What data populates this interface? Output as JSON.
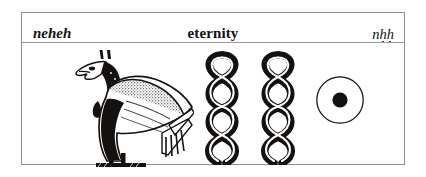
{
  "figure": {
    "caption_row": {
      "left_label": "neheh",
      "center_label": "eternity",
      "right_label_parts": {
        "n": "n",
        "h1": "h",
        "h2": "h"
      },
      "right_label_plain": "nḥḥ"
    },
    "glyphs": [
      {
        "name": "vulture-glyph",
        "gardiner": "G1",
        "description": "vulture standing on ground-line with stippled wing"
      },
      {
        "name": "twisted-wick-glyph-1",
        "gardiner": "V28",
        "description": "twisted flax wick, phonetic h-dot"
      },
      {
        "name": "twisted-wick-glyph-2",
        "gardiner": "V28",
        "description": "twisted flax wick, phonetic h-dot"
      },
      {
        "name": "sun-disk-glyph",
        "gardiner": "N5",
        "description": "sun disk, circle with filled centre dot"
      }
    ],
    "colors": {
      "ink": "#14110f",
      "frame": "#8d8d8d",
      "rule": "#9a9a9a",
      "stipple": "#8e8e8e",
      "paper": "#ffffff"
    }
  }
}
